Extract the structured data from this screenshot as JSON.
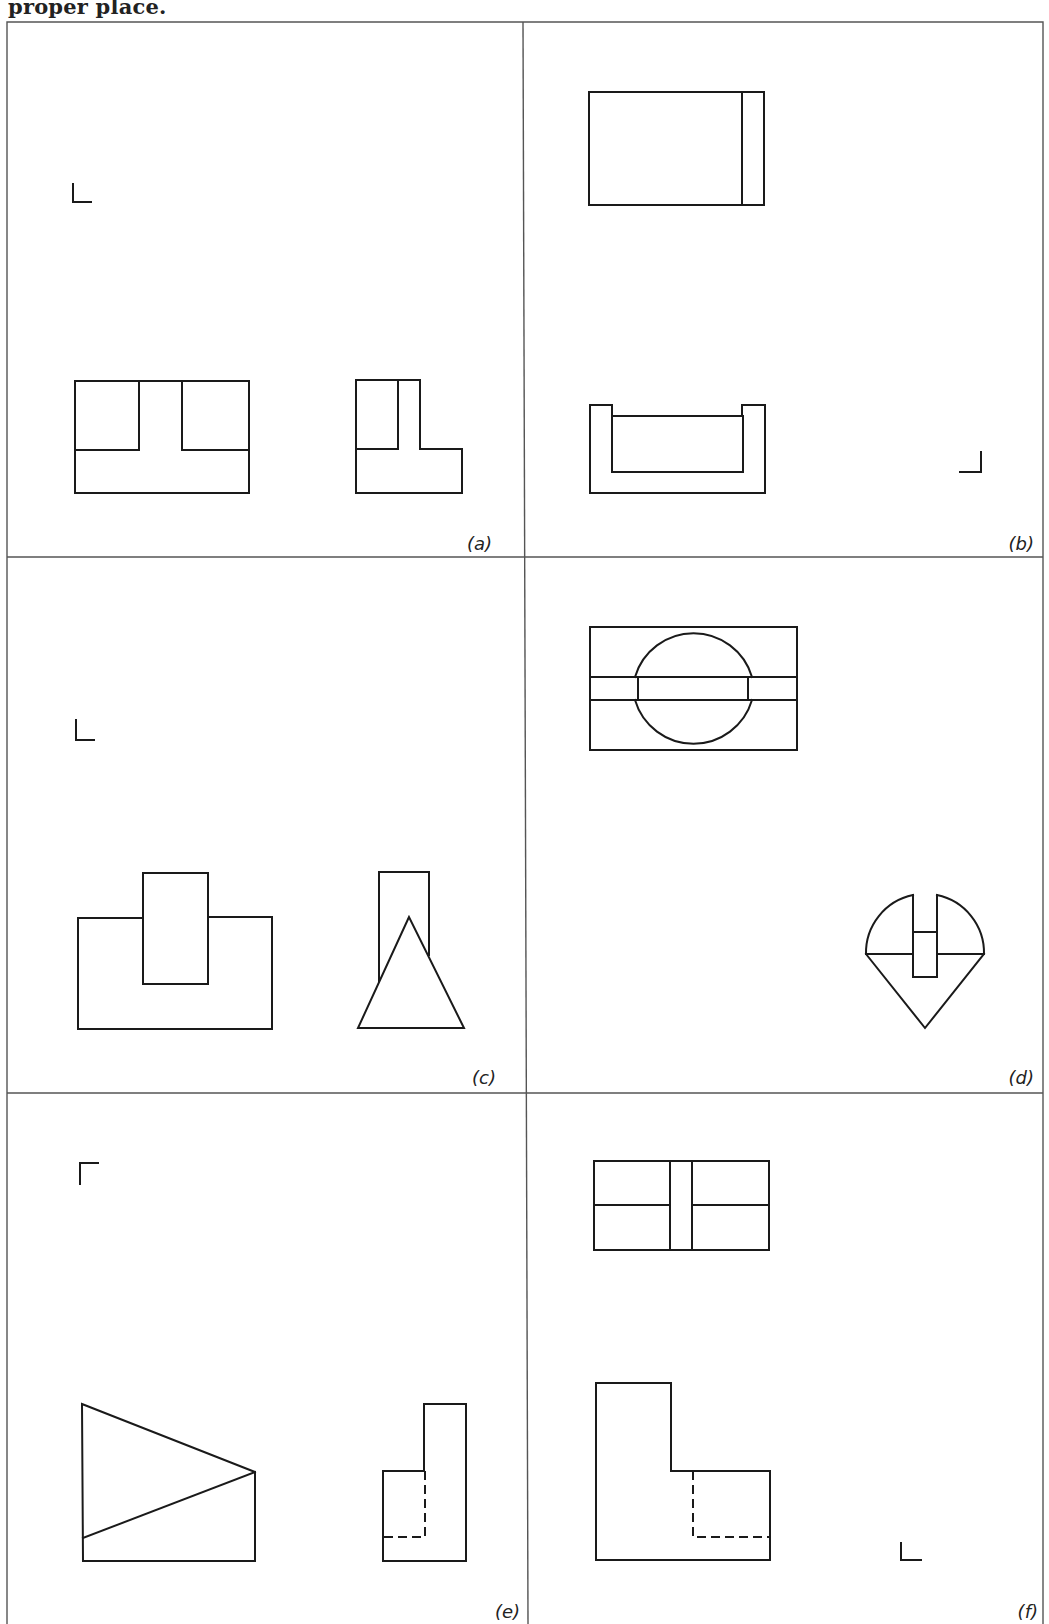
{
  "header": {
    "caption_fragment": "proper place."
  },
  "panels": [
    {
      "id": "a",
      "label": "(a)",
      "views": [
        "front-view",
        "side-view"
      ],
      "orientation_mark": "L-corner-bottom-left"
    },
    {
      "id": "b",
      "label": "(b)",
      "views": [
        "top-view",
        "front-view"
      ],
      "orientation_mark": "L-corner-bottom-right"
    },
    {
      "id": "c",
      "label": "(c)",
      "views": [
        "front-view",
        "side-view"
      ],
      "orientation_mark": "L-corner-bottom-left"
    },
    {
      "id": "d",
      "label": "(d)",
      "views": [
        "top-view",
        "side-view"
      ],
      "orientation_mark": "none"
    },
    {
      "id": "e",
      "label": "(e)",
      "views": [
        "front-view",
        "side-view"
      ],
      "orientation_mark": "L-corner-top-left"
    },
    {
      "id": "f",
      "label": "(f)",
      "views": [
        "top-view",
        "front-view"
      ],
      "orientation_mark": "L-corner-bottom-left"
    }
  ],
  "colors": {
    "line": "#1a1a1a",
    "frame": "#555555",
    "background": "#ffffff"
  }
}
